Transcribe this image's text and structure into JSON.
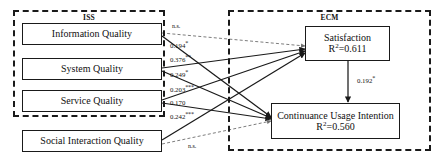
{
  "figure": {
    "type": "structural-equation-model-path-diagram"
  },
  "groups": [
    {
      "id": "iss",
      "title": "ISS"
    },
    {
      "id": "ecm",
      "title": "ECM"
    }
  ],
  "exogenous_nodes": [
    {
      "id": "information-quality",
      "label": "Information Quality"
    },
    {
      "id": "system-quality",
      "label": "System Quality"
    },
    {
      "id": "service-quality",
      "label": "Service Quality"
    },
    {
      "id": "social-interaction-quality",
      "label": "Social Interaction Quality"
    }
  ],
  "endogenous_nodes": [
    {
      "id": "satisfaction",
      "label": "Satisfaction",
      "r2_prefix": "R",
      "r2_exp": "2",
      "r2_value": "=0.611"
    },
    {
      "id": "continuance-usage-intention",
      "label": "Continuance Usage Intention",
      "r2_prefix": "R",
      "r2_exp": "2",
      "r2_value": "=0.560"
    }
  ],
  "path_labels": [
    {
      "id": "iq-to-sat",
      "value": "n.s.",
      "stars": "",
      "significant": false
    },
    {
      "id": "iq-to-cui",
      "value": "0.194",
      "stars": "*",
      "significant": true
    },
    {
      "id": "sq-to-sat",
      "value": "0.376",
      "stars": "**",
      "significant": true
    },
    {
      "id": "sq-to-cui",
      "value": "0.249",
      "stars": "*",
      "significant": true
    },
    {
      "id": "svq-to-sat",
      "value": "0.203",
      "stars": "***",
      "significant": true
    },
    {
      "id": "svq-to-cui",
      "value": "0.170",
      "stars": "",
      "significant": true
    },
    {
      "id": "siq-to-sat",
      "value": "0.242",
      "stars": "***",
      "significant": true
    },
    {
      "id": "siq-to-cui",
      "value": "n.s.",
      "stars": "",
      "significant": false
    },
    {
      "id": "sat-to-cui",
      "value": "0.192",
      "stars": "*",
      "significant": true
    }
  ],
  "colors": {
    "stroke": "#1a1a1a",
    "background": "#ffffff",
    "text": "#111111"
  }
}
